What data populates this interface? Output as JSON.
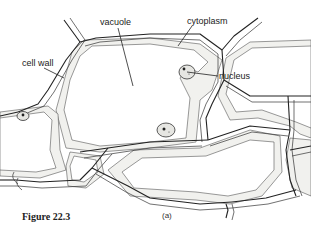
{
  "figure": {
    "caption": "Figure 22.3",
    "panel_label": "(a)",
    "labels": [
      {
        "id": "cell-wall",
        "text": "cell wall"
      },
      {
        "id": "vacuole",
        "text": "vacuole"
      },
      {
        "id": "cytoplasm",
        "text": "cytoplasm"
      },
      {
        "id": "nucleus",
        "text": "nucleus"
      }
    ],
    "colors": {
      "line": "#222222",
      "cytoplasm_fill": "#f1f1ee",
      "background": "#ffffff"
    }
  }
}
